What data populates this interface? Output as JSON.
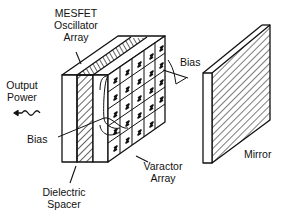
{
  "diagram": {
    "labels": {
      "oscillator_array": [
        "MESFET",
        "Oscillator",
        "Array"
      ],
      "output_power": [
        "Output",
        "Power"
      ],
      "bias_top": "Bias",
      "bias_left": "Bias",
      "varactor_array": [
        "Varactor",
        "Array"
      ],
      "mirror": "Mirror",
      "dielectric_spacer": [
        "Dielectric",
        "Spacer"
      ]
    },
    "components": [
      "MESFET Oscillator Array",
      "Dielectric Spacer",
      "Varactor Array",
      "Mirror"
    ],
    "colors": {
      "line": "#111111",
      "background": "#ffffff"
    }
  }
}
